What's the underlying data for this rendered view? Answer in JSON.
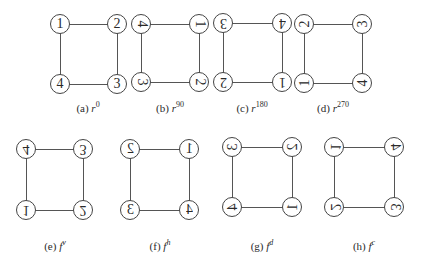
{
  "panels": [
    {
      "id": "a",
      "caption_prefix": "(a)",
      "symbol": "r",
      "sup": "0",
      "nodes": {
        "tl": "1",
        "tr": "2",
        "bl": "4",
        "br": "3"
      },
      "transforms": {
        "tl": "none",
        "tr": "none",
        "bl": "none",
        "br": "none"
      }
    },
    {
      "id": "b",
      "caption_prefix": "(b)",
      "symbol": "r",
      "sup": "90",
      "nodes": {
        "tl": "4",
        "tr": "1",
        "bl": "3",
        "br": "2"
      },
      "transforms": {
        "tl": "rotate(90deg)",
        "tr": "rotate(90deg)",
        "bl": "rotate(90deg)",
        "br": "rotate(90deg)"
      }
    },
    {
      "id": "c",
      "caption_prefix": "(c)",
      "symbol": "r",
      "sup": "180",
      "nodes": {
        "tl": "3",
        "tr": "4",
        "bl": "2",
        "br": "1"
      },
      "transforms": {
        "tl": "rotate(180deg)",
        "tr": "rotate(180deg)",
        "bl": "rotate(180deg)",
        "br": "rotate(180deg)"
      }
    },
    {
      "id": "d",
      "caption_prefix": "(d)",
      "symbol": "r",
      "sup": "270",
      "nodes": {
        "tl": "2",
        "tr": "3",
        "bl": "1",
        "br": "4"
      },
      "transforms": {
        "tl": "rotate(270deg)",
        "tr": "rotate(270deg)",
        "bl": "rotate(270deg)",
        "br": "rotate(270deg)"
      }
    },
    {
      "id": "e",
      "caption_prefix": "(e)",
      "symbol": "f",
      "sup": "v",
      "nodes": {
        "tl": "4",
        "tr": "3",
        "bl": "1",
        "br": "2"
      },
      "transforms": {
        "tl": "scaleY(-1)",
        "tr": "scaleY(-1)",
        "bl": "scaleY(-1)",
        "br": "scaleY(-1)"
      }
    },
    {
      "id": "f",
      "caption_prefix": "(f)",
      "symbol": "f",
      "sup": "h",
      "nodes": {
        "tl": "2",
        "tr": "1",
        "bl": "3",
        "br": "4"
      },
      "transforms": {
        "tl": "scaleX(-1)",
        "tr": "scaleX(-1)",
        "bl": "scaleX(-1)",
        "br": "scaleX(-1)"
      }
    },
    {
      "id": "g",
      "caption_prefix": "(g)",
      "symbol": "f",
      "sup": "d",
      "nodes": {
        "tl": "3",
        "tr": "2",
        "bl": "4",
        "br": "1"
      },
      "transforms": {
        "tl": "rotate(90deg) scaleY(-1)",
        "tr": "rotate(90deg) scaleY(-1)",
        "bl": "rotate(90deg) scaleY(-1)",
        "br": "rotate(90deg) scaleY(-1)"
      }
    },
    {
      "id": "h",
      "caption_prefix": "(h)",
      "symbol": "f",
      "sup": "c",
      "nodes": {
        "tl": "1",
        "tr": "4",
        "bl": "2",
        "br": "3"
      },
      "transforms": {
        "tl": "rotate(-90deg) scaleY(-1)",
        "tr": "rotate(-90deg) scaleY(-1)",
        "bl": "rotate(-90deg) scaleY(-1)",
        "br": "rotate(-90deg) scaleY(-1)"
      }
    }
  ]
}
